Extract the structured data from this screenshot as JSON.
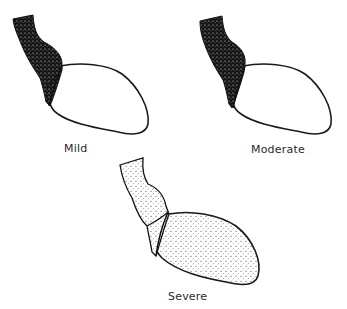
{
  "panels": [
    {
      "id": "mild",
      "label": "Mild",
      "aorta_fill": "dark",
      "ventricle_fill": "partial-light"
    },
    {
      "id": "moderate",
      "label": "Moderate",
      "aorta_fill": "dark",
      "ventricle_fill": "half-medium"
    },
    {
      "id": "severe",
      "label": "Severe",
      "aorta_fill": "light-uniform",
      "ventricle_fill": "full-uniform"
    }
  ],
  "colors": {
    "ink": "#1a1a1a",
    "background": "#ffffff"
  }
}
